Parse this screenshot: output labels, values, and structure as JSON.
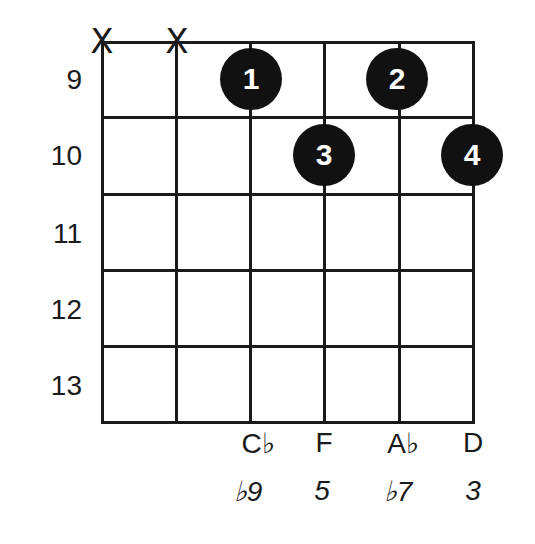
{
  "diagram": {
    "type": "guitar-chord-chart",
    "fret_labels": [
      "9",
      "10",
      "11",
      "12",
      "13"
    ],
    "strings": [
      {
        "index": 0,
        "mute": "X",
        "note": "",
        "interval": ""
      },
      {
        "index": 1,
        "mute": "X",
        "note": "",
        "interval": ""
      },
      {
        "index": 2,
        "mute": "",
        "note": "C♭",
        "interval": "♭9"
      },
      {
        "index": 3,
        "mute": "",
        "note": "F",
        "interval": "5"
      },
      {
        "index": 4,
        "mute": "",
        "note": "A♭",
        "interval": "♭7"
      },
      {
        "index": 5,
        "mute": "",
        "note": "D",
        "interval": "3"
      }
    ],
    "fingers": [
      {
        "finger": "1",
        "string": 2,
        "fret": "9"
      },
      {
        "finger": "2",
        "string": 4,
        "fret": "9"
      },
      {
        "finger": "3",
        "string": 3,
        "fret": "10"
      },
      {
        "finger": "4",
        "string": 5,
        "fret": "10"
      }
    ],
    "colors": {
      "line": "#1a1a1a",
      "dot": "#111111",
      "dot_text": "#ffffff"
    }
  }
}
